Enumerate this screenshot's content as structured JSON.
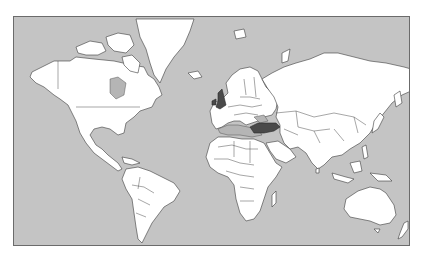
{
  "map": {
    "type": "world-political-outline",
    "projection": "Mercator",
    "colors": {
      "ocean": "#c4c4c4",
      "land": "#ffffff",
      "borders": "#3a3a3a",
      "highlighted": "#4a4a4a",
      "frame": "#6b6b6b"
    },
    "highlighted_countries": [
      {
        "name": "United Kingdom",
        "fill": "#4a4a4a"
      },
      {
        "name": "Turkey",
        "fill": "#4a4a4a"
      }
    ]
  }
}
